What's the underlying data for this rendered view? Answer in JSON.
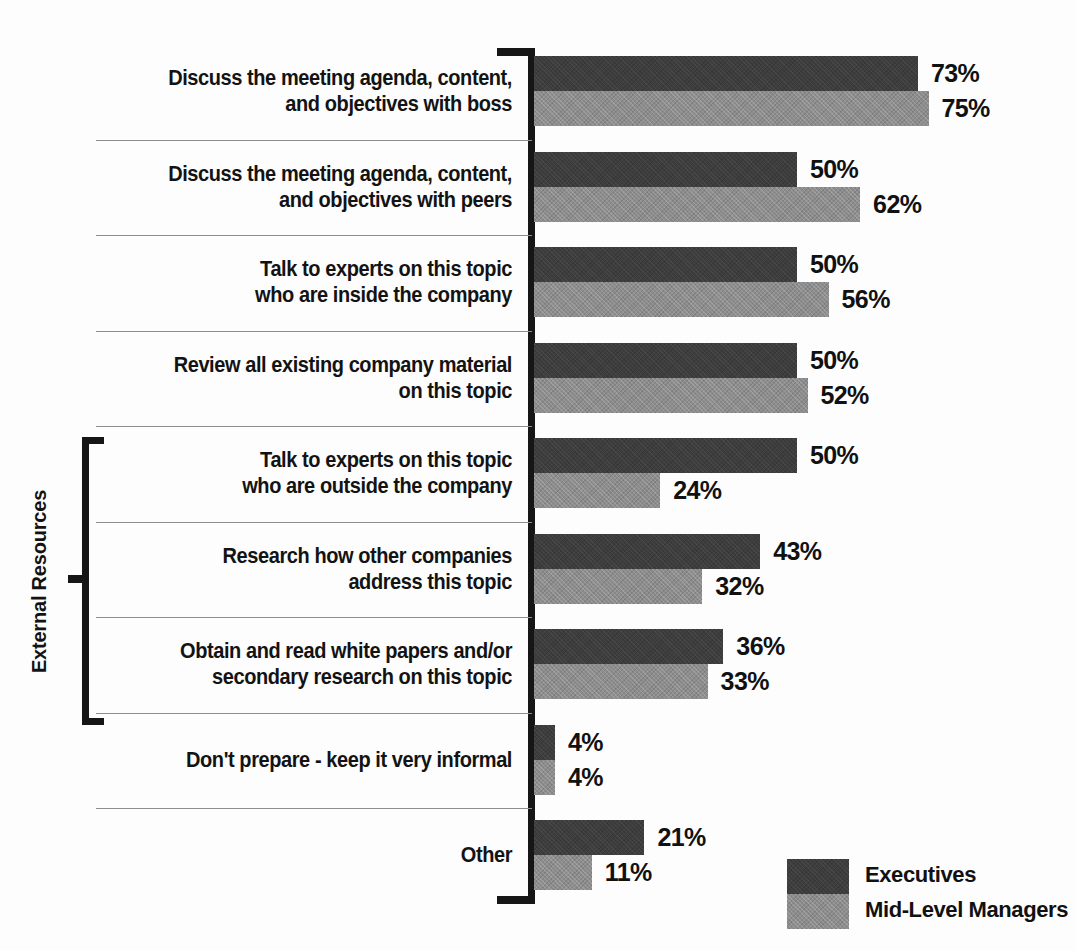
{
  "chart_data": {
    "type": "bar",
    "orientation": "horizontal",
    "title": "",
    "xlabel": "",
    "ylabel": "",
    "xlim": [
      0,
      100
    ],
    "grid": false,
    "legend_position": "bottom-right",
    "value_suffix": "%",
    "categories": [
      "Discuss the meeting agenda, content, and objectives with boss",
      "Discuss the meeting agenda, content, and objectives with peers",
      "Talk to experts on this topic who are inside the company",
      "Review all existing company material on this topic",
      "Talk to experts on this topic who are outside the company",
      "Research how other companies address this topic",
      "Obtain and read white papers and/or secondary research on this topic",
      "Don't prepare - keep it very informal",
      "Other"
    ],
    "series": [
      {
        "name": "Executives",
        "color": "#3d3d3d",
        "values": [
          73,
          50,
          50,
          50,
          50,
          43,
          36,
          4,
          21
        ]
      },
      {
        "name": "Mid-Level Managers",
        "color": "#8d8d8d",
        "values": [
          75,
          62,
          56,
          52,
          24,
          32,
          33,
          4,
          11
        ]
      }
    ],
    "annotations": [
      {
        "text": "External Resources",
        "covers_categories": [
          4,
          5,
          6
        ]
      }
    ]
  },
  "rows": [
    {
      "lines": [
        "Discuss the meeting agenda, content,",
        "and objectives with boss"
      ],
      "exec": "73%",
      "mid": "75%",
      "exec_v": 73,
      "mid_v": 75
    },
    {
      "lines": [
        "Discuss the meeting agenda, content,",
        "and objectives with peers"
      ],
      "exec": "50%",
      "mid": "62%",
      "exec_v": 50,
      "mid_v": 62
    },
    {
      "lines": [
        "Talk to experts on this topic",
        "who are inside the company"
      ],
      "exec": "50%",
      "mid": "56%",
      "exec_v": 50,
      "mid_v": 56
    },
    {
      "lines": [
        "Review all existing company material",
        "on this topic"
      ],
      "exec": "50%",
      "mid": "52%",
      "exec_v": 50,
      "mid_v": 52
    },
    {
      "lines": [
        "Talk to experts on this topic",
        "who are outside the company"
      ],
      "exec": "50%",
      "mid": "24%",
      "exec_v": 50,
      "mid_v": 24
    },
    {
      "lines": [
        "Research how other companies",
        "address this topic"
      ],
      "exec": "43%",
      "mid": "32%",
      "exec_v": 43,
      "mid_v": 32
    },
    {
      "lines": [
        "Obtain and read white papers and/or",
        "secondary research on this topic"
      ],
      "exec": "36%",
      "mid": "33%",
      "exec_v": 36,
      "mid_v": 33
    },
    {
      "lines": [
        "Don't prepare - keep it very informal"
      ],
      "exec": "4%",
      "mid": "4%",
      "exec_v": 4,
      "mid_v": 4
    },
    {
      "lines": [
        "Other"
      ],
      "exec": "21%",
      "mid": "11%",
      "exec_v": 21,
      "mid_v": 11
    }
  ],
  "bracket": {
    "label": "External Resources"
  },
  "legend": {
    "items": [
      {
        "label": "Executives",
        "color": "#3d3d3d"
      },
      {
        "label": "Mid-Level Managers",
        "color": "#8d8d8d"
      }
    ]
  },
  "colors": {
    "executives": "#3d3d3d",
    "mid_level_managers": "#8d8d8d",
    "axis": "#161616",
    "separator": "#8d8d8d",
    "text": "#111111",
    "background": "#fdfdfd"
  }
}
